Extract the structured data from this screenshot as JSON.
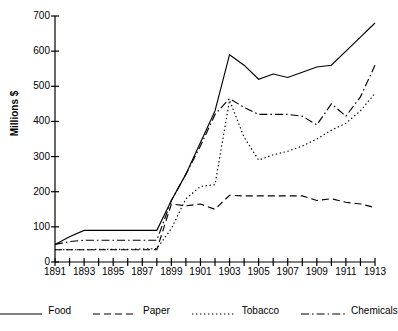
{
  "chart_data": {
    "type": "line",
    "title": "",
    "xlabel": "",
    "ylabel": "Millions $",
    "xlim": [
      1891,
      1913
    ],
    "ylim": [
      0,
      700
    ],
    "ytick_step": 100,
    "yticks": [
      0,
      100,
      200,
      300,
      400,
      500,
      600,
      700
    ],
    "xticks_all": [
      1891,
      1892,
      1893,
      1894,
      1895,
      1896,
      1897,
      1898,
      1899,
      1900,
      1901,
      1902,
      1903,
      1904,
      1905,
      1906,
      1907,
      1908,
      1909,
      1910,
      1911,
      1912,
      1913
    ],
    "xtick_labels": [
      "1891",
      "1893",
      "1895",
      "1897",
      "1899",
      "1901",
      "1903",
      "1905",
      "1907",
      "1909",
      "1911",
      "1913"
    ],
    "xtick_label_values": [
      1891,
      1893,
      1895,
      1897,
      1899,
      1901,
      1903,
      1905,
      1907,
      1909,
      1911,
      1913
    ],
    "grid": false,
    "legend_position": "bottom",
    "x": [
      1891,
      1892,
      1893,
      1894,
      1895,
      1896,
      1897,
      1898,
      1899,
      1900,
      1901,
      1902,
      1903,
      1904,
      1905,
      1906,
      1907,
      1908,
      1909,
      1910,
      1911,
      1912,
      1913
    ],
    "series": [
      {
        "name": "Food",
        "style": "solid",
        "color": "#000000",
        "values": [
          50,
          72,
          90,
          90,
          90,
          90,
          90,
          90,
          175,
          250,
          340,
          430,
          590,
          560,
          520,
          535,
          525,
          540,
          555,
          560,
          600,
          640,
          680
        ]
      },
      {
        "name": "Paper",
        "style": "dashed",
        "color": "#000000",
        "values": [
          35,
          35,
          35,
          35,
          35,
          35,
          35,
          35,
          165,
          160,
          165,
          150,
          190,
          188,
          188,
          188,
          188,
          188,
          175,
          180,
          170,
          165,
          155
        ]
      },
      {
        "name": "Tobacco",
        "style": "dotted",
        "color": "#000000",
        "values": [
          35,
          35,
          35,
          36,
          36,
          36,
          37,
          38,
          95,
          180,
          215,
          220,
          460,
          355,
          290,
          305,
          315,
          330,
          350,
          375,
          395,
          430,
          480
        ]
      },
      {
        "name": "Chemicals",
        "style": "dashdot",
        "color": "#000000",
        "values": [
          50,
          58,
          62,
          62,
          62,
          62,
          62,
          62,
          175,
          250,
          330,
          420,
          465,
          440,
          420,
          420,
          420,
          415,
          390,
          450,
          415,
          470,
          560
        ]
      }
    ]
  },
  "legend": {
    "items": [
      {
        "label": "Food"
      },
      {
        "label": "Paper"
      },
      {
        "label": "Tobacco"
      },
      {
        "label": "Chemicals"
      }
    ]
  }
}
